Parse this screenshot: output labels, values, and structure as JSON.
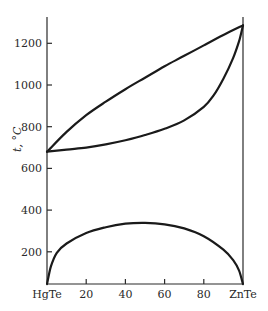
{
  "chart_data": {
    "type": "line",
    "title": "",
    "xlabel": "",
    "ylabel": "t, °C",
    "x_range": [
      0,
      100
    ],
    "ylim": [
      45,
      1330
    ],
    "grid": false,
    "legend": null,
    "x_ticks": [
      {
        "value": 0,
        "label": "HgTe"
      },
      {
        "value": 20,
        "label": "20"
      },
      {
        "value": 40,
        "label": "40"
      },
      {
        "value": 60,
        "label": "60"
      },
      {
        "value": 80,
        "label": "80"
      },
      {
        "value": 100,
        "label": "ZnTe"
      }
    ],
    "y_ticks": [
      {
        "value": 200,
        "label": "200"
      },
      {
        "value": 400,
        "label": "400"
      },
      {
        "value": 600,
        "label": "600"
      },
      {
        "value": 800,
        "label": "800"
      },
      {
        "value": 1000,
        "label": "1000"
      },
      {
        "value": 1200,
        "label": "1200"
      }
    ],
    "series": [
      {
        "name": "liquidus",
        "x": [
          0,
          10,
          20,
          30,
          40,
          50,
          60,
          70,
          80,
          90,
          100
        ],
        "y": [
          680,
          775,
          855,
          920,
          980,
          1035,
          1090,
          1140,
          1190,
          1240,
          1286
        ]
      },
      {
        "name": "solidus",
        "x": [
          0,
          10,
          20,
          30,
          40,
          50,
          60,
          70,
          80,
          85,
          90,
          95,
          98,
          100
        ],
        "y": [
          680,
          690,
          700,
          715,
          735,
          760,
          790,
          830,
          895,
          950,
          1030,
          1130,
          1210,
          1286
        ]
      },
      {
        "name": "miscibility-gap",
        "x": [
          0,
          2,
          5,
          10,
          20,
          30,
          40,
          50,
          60,
          70,
          80,
          90,
          95,
          98,
          100
        ],
        "y": [
          45,
          130,
          195,
          240,
          290,
          318,
          335,
          339,
          332,
          312,
          275,
          210,
          160,
          110,
          45
        ]
      }
    ]
  },
  "plot": {
    "x0_px": 47,
    "x1_px": 243,
    "zero_y_px": 293.5,
    "px_per_degree": 0.2085,
    "axis_top_px": 17,
    "baseline_px": 284
  }
}
